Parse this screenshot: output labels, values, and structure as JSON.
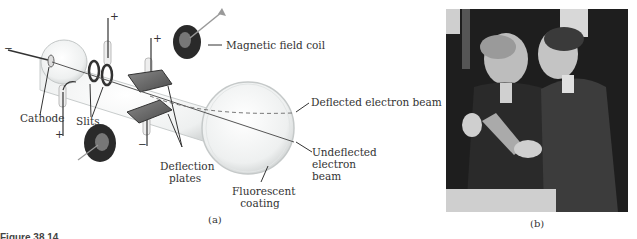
{
  "figure": {
    "caption_partial": "Figure 38.14",
    "panel_a": {
      "label": "(a)",
      "annotations": {
        "magnetic_field_coil": "Magnetic field coil",
        "deflected_beam": "Deflected electron beam",
        "undeflected_line1": "Undeflected",
        "undeflected_line2": "electron",
        "undeflected_line3": "beam",
        "cathode": "Cathode",
        "slits": "Slits",
        "deflection_line1": "Deflection",
        "deflection_line2": "plates",
        "fluorescent_line1": "Fluorescent",
        "fluorescent_line2": "coating"
      },
      "polarity": {
        "cathode_minus": "−",
        "anode_top_plus": "+",
        "anode_bottom_plus": "+",
        "plate_top_plus": "+",
        "plate_bottom_minus": "−"
      }
    },
    "panel_b": {
      "label": "(b)",
      "description": "Black-and-white photograph of two men examining a cathode-ray tube"
    }
  }
}
